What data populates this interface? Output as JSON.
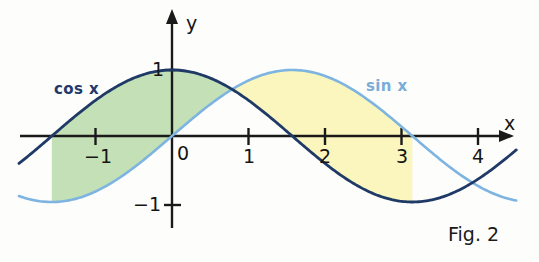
{
  "figure": {
    "caption": "Fig. 2",
    "axis_x_label": "x",
    "axis_y_label": "y"
  },
  "labels": {
    "cos": "cos x",
    "sin": "sin x"
  },
  "ticks": {
    "x": [
      {
        "value": -1,
        "text": "−1"
      },
      {
        "value": 0,
        "text": "0"
      },
      {
        "value": 1,
        "text": "1"
      },
      {
        "value": 2,
        "text": "2"
      },
      {
        "value": 3,
        "text": "3"
      },
      {
        "value": 4,
        "text": "4"
      }
    ],
    "y": [
      {
        "value": 1,
        "text": "1"
      },
      {
        "value": -1,
        "text": "−1"
      }
    ]
  },
  "colors": {
    "cos_curve": "#1f3a66",
    "sin_curve": "#7db4e0",
    "green_fill": "#c3e0b6",
    "yellow_fill": "#fbf6bd",
    "axis": "#1a1a1a",
    "background": "#fdfdfc"
  },
  "chart_data": {
    "type": "line",
    "title": "Fig. 2",
    "xlabel": "x",
    "ylabel": "y",
    "grid": false,
    "legend": "inline-curve-labels",
    "xlim": [
      -2.0,
      4.5
    ],
    "ylim": [
      -1.9,
      1.9
    ],
    "xticks": [
      -1,
      0,
      1,
      2,
      3,
      4
    ],
    "yticks": [
      -1,
      1
    ],
    "series": [
      {
        "name": "cos x",
        "color": "#1f3a66",
        "formula": "y = cos(x)",
        "x": [
          -2.0,
          -1.5708,
          -1.0,
          -0.5,
          0.0,
          0.5,
          0.7854,
          1.0,
          1.5708,
          2.0,
          2.5,
          3.0,
          3.1416,
          3.5,
          4.0,
          4.5
        ],
        "y": [
          -0.416,
          0.0,
          0.54,
          0.878,
          1.0,
          0.878,
          0.707,
          0.54,
          0.0,
          -0.416,
          -0.801,
          -0.99,
          -1.0,
          -0.936,
          -0.654,
          -0.211
        ]
      },
      {
        "name": "sin x",
        "color": "#7db4e0",
        "formula": "y = sin(x)",
        "x": [
          -2.0,
          -1.5708,
          -1.0,
          -0.5,
          0.0,
          0.5,
          0.7854,
          1.0,
          1.5708,
          2.0,
          2.5,
          3.0,
          3.1416,
          3.5,
          4.0,
          4.5
        ],
        "y": [
          -0.909,
          -1.0,
          -0.841,
          -0.479,
          0.0,
          0.479,
          0.707,
          0.841,
          1.0,
          0.909,
          0.599,
          0.141,
          0.0,
          -0.351,
          -0.757,
          -0.978
        ]
      }
    ],
    "shaded_regions": [
      {
        "name": "green-region",
        "color": "#c3e0b6",
        "x_from": -1.5708,
        "x_to": 0.7854,
        "upper_curve": "cos x",
        "lower_curve": "sin x"
      },
      {
        "name": "yellow-region",
        "color": "#fbf6bd",
        "x_from": 0.7854,
        "x_to": 3.1416,
        "upper_curve": "sin x",
        "lower_curve": "cos x"
      }
    ]
  }
}
